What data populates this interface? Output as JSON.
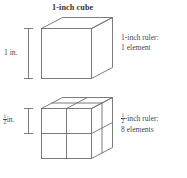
{
  "figure": {
    "title": "1-inch cube",
    "background_color": "#ffffff",
    "line_color": "#6e6e6e",
    "text_color": "#3a3a3a"
  },
  "panels": [
    {
      "id": "one-inch-cube",
      "heading": "1-inch cube",
      "dimension_label": "1 in.",
      "note_line_1": "1-inch ruler:",
      "note_line_2": "1 element",
      "subdivisions_per_edge": 1,
      "total_elements": 1
    },
    {
      "id": "half-inch-subdivided-cube",
      "heading": "",
      "dimension_numerator": "1",
      "dimension_denominator": "2",
      "dimension_unit": "in.",
      "note_numerator": "1",
      "note_denominator": "2",
      "note_line_1_suffix": "-inch ruler:",
      "note_line_2": "8 elements",
      "subdivisions_per_edge": 2,
      "total_elements": 8
    }
  ]
}
